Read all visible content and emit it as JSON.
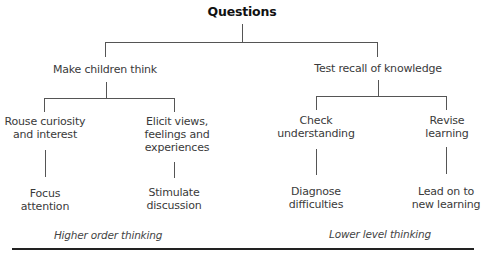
{
  "diagram": {
    "title": "Questions",
    "branches": [
      {
        "label": "Make children think",
        "children": [
          {
            "label_lines": [
              "Rouse curiosity",
              "and interest"
            ],
            "child_lines": [
              "Focus",
              "attention"
            ]
          },
          {
            "label_lines": [
              "Elicit views,",
              "feelings and",
              "experiences"
            ],
            "child_lines": [
              "Stimulate",
              "discussion"
            ]
          }
        ],
        "footer": "Higher order thinking"
      },
      {
        "label": "Test recall of knowledge",
        "children": [
          {
            "label_lines": [
              "Check",
              "understanding"
            ],
            "child_lines": [
              "Diagnose",
              "difficulties"
            ]
          },
          {
            "label_lines": [
              "Revise",
              "learning"
            ],
            "child_lines": [
              "Lead on to",
              "new learning"
            ]
          }
        ],
        "footer": "Lower level thinking"
      }
    ]
  }
}
